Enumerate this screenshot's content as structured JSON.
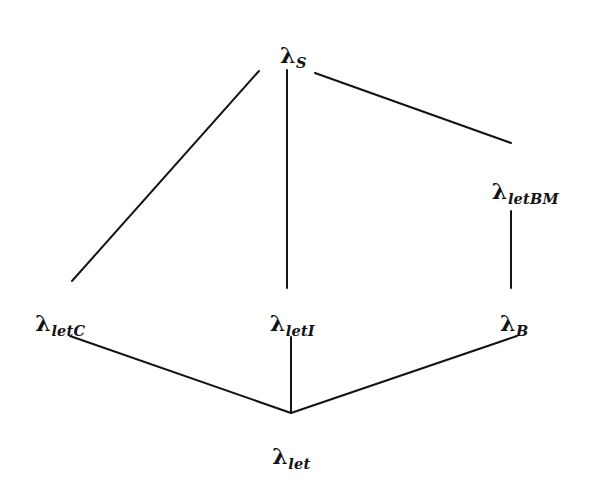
{
  "diagram": {
    "kind": "lattice-hasse-diagram",
    "title": "",
    "ink_color": "#131313",
    "background_color": "#ffffff",
    "nodes": [
      {
        "id": "lambda-s",
        "name": "lambda-s",
        "base": "λ",
        "subscript": "S",
        "full_label": "λS",
        "x": 293,
        "y": 44
      },
      {
        "id": "lambda-letbm",
        "name": "lambda-letbm",
        "base": "λ",
        "subscript": "letBM",
        "full_label": "λletBM",
        "x": 525,
        "y": 180
      },
      {
        "id": "lambda-letc",
        "name": "lambda-letc",
        "base": "λ",
        "subscript": "letC",
        "full_label": "λletC",
        "x": 60,
        "y": 312
      },
      {
        "id": "lambda-leti",
        "name": "lambda-leti",
        "base": "λ",
        "subscript": "letI",
        "full_label": "λletI",
        "x": 292,
        "y": 312
      },
      {
        "id": "lambda-b",
        "name": "lambda-b",
        "base": "λ",
        "subscript": "B",
        "full_label": "λB",
        "x": 514,
        "y": 312
      },
      {
        "id": "lambda-let",
        "name": "lambda-let",
        "base": "λ",
        "subscript": "let",
        "full_label": "λlet",
        "x": 291,
        "y": 445
      }
    ],
    "edges": [
      {
        "id": "edge-letc-s",
        "from": "lambda-letc",
        "to": "lambda-s",
        "x1": 72,
        "y1": 281,
        "x2": 259,
        "y2": 71
      },
      {
        "id": "edge-leti-s",
        "from": "lambda-leti",
        "to": "lambda-s",
        "x1": 287,
        "y1": 288,
        "x2": 287,
        "y2": 70
      },
      {
        "id": "edge-s-letbm",
        "from": "lambda-s",
        "to": "lambda-letbm",
        "x1": 315,
        "y1": 73,
        "x2": 511,
        "y2": 143
      },
      {
        "id": "edge-letbm-b",
        "from": "lambda-letbm",
        "to": "lambda-b",
        "x1": 511,
        "y1": 211,
        "x2": 511,
        "y2": 288
      },
      {
        "id": "edge-let-letc",
        "from": "lambda-let",
        "to": "lambda-letc",
        "x1": 291,
        "y1": 413,
        "x2": 70,
        "y2": 336
      },
      {
        "id": "edge-let-leti",
        "from": "lambda-let",
        "to": "lambda-leti",
        "x1": 291,
        "y1": 413,
        "x2": 291,
        "y2": 337
      },
      {
        "id": "edge-let-b",
        "from": "lambda-let",
        "to": "lambda-b",
        "x1": 291,
        "y1": 413,
        "x2": 517,
        "y2": 336
      }
    ]
  }
}
